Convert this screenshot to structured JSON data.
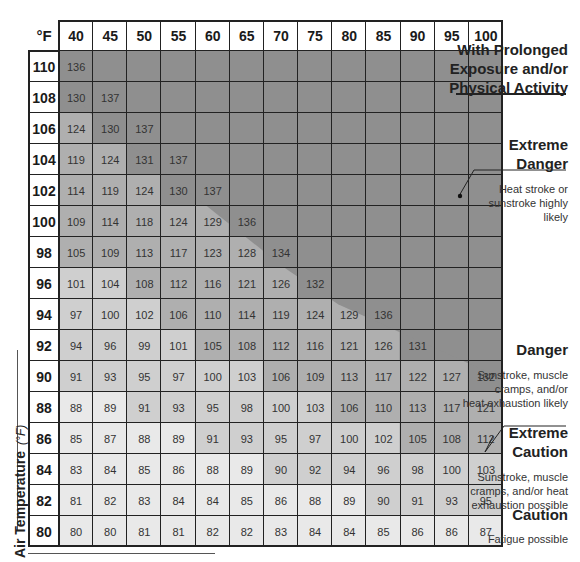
{
  "chart_data": {
    "type": "table",
    "corner_label": "°F",
    "xlabel": "Relative Humidity (%)",
    "ylabel": "Air Temperature",
    "ylabel_unit": "(°F)",
    "columns": [
      40,
      45,
      50,
      55,
      60,
      65,
      70,
      75,
      80,
      85,
      90,
      95,
      100
    ],
    "rows": [
      {
        "temp": 110,
        "values": [
          136,
          null,
          null,
          null,
          null,
          null,
          null,
          null,
          null,
          null,
          null,
          null,
          null
        ]
      },
      {
        "temp": 108,
        "values": [
          130,
          137,
          null,
          null,
          null,
          null,
          null,
          null,
          null,
          null,
          null,
          null,
          null
        ]
      },
      {
        "temp": 106,
        "values": [
          124,
          130,
          137,
          null,
          null,
          null,
          null,
          null,
          null,
          null,
          null,
          null,
          null
        ]
      },
      {
        "temp": 104,
        "values": [
          119,
          124,
          131,
          137,
          null,
          null,
          null,
          null,
          null,
          null,
          null,
          null,
          null
        ]
      },
      {
        "temp": 102,
        "values": [
          114,
          119,
          124,
          130,
          137,
          null,
          null,
          null,
          null,
          null,
          null,
          null,
          null
        ]
      },
      {
        "temp": 100,
        "values": [
          109,
          114,
          118,
          124,
          129,
          136,
          null,
          null,
          null,
          null,
          null,
          null,
          null
        ]
      },
      {
        "temp": 98,
        "values": [
          105,
          109,
          113,
          117,
          123,
          128,
          134,
          null,
          null,
          null,
          null,
          null,
          null
        ]
      },
      {
        "temp": 96,
        "values": [
          101,
          104,
          108,
          112,
          116,
          121,
          126,
          132,
          null,
          null,
          null,
          null,
          null
        ]
      },
      {
        "temp": 94,
        "values": [
          97,
          100,
          102,
          106,
          110,
          114,
          119,
          124,
          129,
          136,
          null,
          null,
          null
        ]
      },
      {
        "temp": 92,
        "values": [
          94,
          96,
          99,
          101,
          105,
          108,
          112,
          116,
          121,
          126,
          131,
          null,
          null
        ]
      },
      {
        "temp": 90,
        "values": [
          91,
          93,
          95,
          97,
          100,
          103,
          106,
          109,
          113,
          117,
          122,
          127,
          132
        ]
      },
      {
        "temp": 88,
        "values": [
          88,
          89,
          91,
          93,
          95,
          98,
          100,
          103,
          106,
          110,
          113,
          117,
          121
        ]
      },
      {
        "temp": 86,
        "values": [
          85,
          87,
          88,
          89,
          91,
          93,
          95,
          97,
          100,
          102,
          105,
          108,
          112
        ]
      },
      {
        "temp": 84,
        "values": [
          83,
          84,
          85,
          86,
          88,
          89,
          90,
          92,
          94,
          96,
          98,
          100,
          103
        ]
      },
      {
        "temp": 82,
        "values": [
          81,
          82,
          83,
          84,
          84,
          85,
          86,
          88,
          89,
          90,
          91,
          93,
          95
        ]
      },
      {
        "temp": 80,
        "values": [
          80,
          80,
          81,
          81,
          82,
          82,
          83,
          84,
          84,
          85,
          86,
          86,
          87
        ]
      }
    ],
    "legend_header": "With Prolonged Exposure and/or Physical Activity",
    "legend": [
      {
        "level": "Extreme Danger",
        "description": "Heat stroke or sunstroke highly likely",
        "range": ">=130",
        "color": "#8f8f8f"
      },
      {
        "level": "Danger",
        "description": "Sunstroke, muscle cramps, and/or heat exhaustion likely",
        "range": "105-129",
        "color": "#b0b0b0"
      },
      {
        "level": "Extreme Caution",
        "description": "Sunstroke, muscle cramps, and/or heat exhaustion possible",
        "range": "90-104",
        "color": "#d2d2d2"
      },
      {
        "level": "Caution",
        "description": "Fatigue possible",
        "range": "80-89",
        "color": "#ececec"
      }
    ]
  },
  "legend_ui": {
    "header": [
      "With Prolonged",
      "Exposure and/or",
      "Physical Activity"
    ],
    "extreme_danger": {
      "title": [
        "Extreme",
        "Danger"
      ],
      "desc": [
        "Heat stroke or",
        "sunstroke highly",
        "likely"
      ]
    },
    "danger": {
      "title": [
        "Danger"
      ],
      "desc": [
        "Sunstroke, muscle",
        "cramps, and/or",
        "heat exhaustion likely"
      ]
    },
    "extreme_caution": {
      "title": [
        "Extreme",
        "Caution"
      ],
      "desc": [
        "Sunstroke, muscle",
        "cramps, and/or heat",
        "exhaustion possible"
      ]
    },
    "caution": {
      "title": [
        "Caution"
      ],
      "desc": [
        "Fatigue possible"
      ]
    }
  },
  "colors": {
    "extreme_danger": "#8f8f8f",
    "danger": "#afafaf",
    "extreme_caution": "#cfcfcf",
    "caution": "#e9e9e9",
    "none": "#f8f8f8",
    "grid": "#222222"
  }
}
